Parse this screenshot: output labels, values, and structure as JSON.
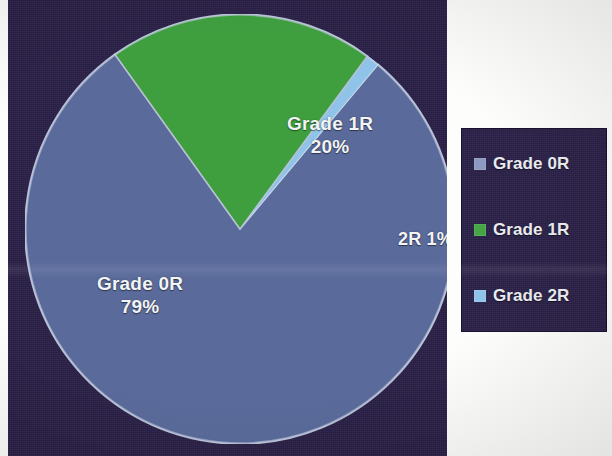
{
  "chart_data": {
    "type": "pie",
    "title": "",
    "categories": [
      "Grade 0R",
      "Grade 1R",
      "Grade 2R"
    ],
    "values": [
      79,
      20,
      1
    ],
    "value_unit": "%",
    "slice_labels": [
      {
        "name": "Grade 0R",
        "pct": "79%",
        "text_line1": "Grade 0R",
        "text_line2": "79%"
      },
      {
        "name": "Grade 1R",
        "pct": "20%",
        "text_line1": "Grade 1R",
        "text_line2": "20%"
      },
      {
        "name": "Grade 2R",
        "pct": "1%",
        "text_line1": "2R 1%",
        "text_line2": ""
      }
    ],
    "colors": [
      "#5a6a9a",
      "#3f9f3f",
      "#8fc3e8"
    ],
    "legend_position": "right",
    "start_angle_deg": -50,
    "grid": false
  },
  "chart": {
    "labels": {
      "grade0r_name": "Grade 0R",
      "grade0r_pct": "79%",
      "grade1r_name": "Grade 1R",
      "grade1r_pct": "20%",
      "grade2r_inline": "2R 1%"
    }
  },
  "legend": {
    "items": [
      {
        "label": "Grade 0R",
        "color": "#8c99c0"
      },
      {
        "label": "Grade 1R",
        "color": "#46a546"
      },
      {
        "label": "Grade 2R",
        "color": "#8fc3e8"
      }
    ]
  },
  "theme": {
    "panel_background": "#2a2047",
    "legend_background": "#2b2148",
    "page_background": "#fdfdfb",
    "text_color": "#e9ecef",
    "slice_0r": "#5a6a9a",
    "slice_1r": "#3f9f3f",
    "slice_2r": "#8fc3e8",
    "pie_outline": "#b9c2d6"
  }
}
